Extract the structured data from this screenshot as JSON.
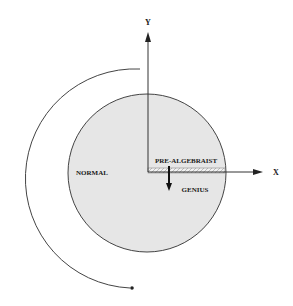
{
  "diagram": {
    "axes": {
      "x_label": "X",
      "y_label": "Y"
    },
    "regions": {
      "normal": "NORMAL",
      "pre_algebraist": "PRE-ALGEBRAIST",
      "genius": "GENIUS"
    },
    "colors": {
      "circle_fill": "#e6e6e6",
      "stroke": "#333333",
      "background": "#ffffff"
    }
  }
}
